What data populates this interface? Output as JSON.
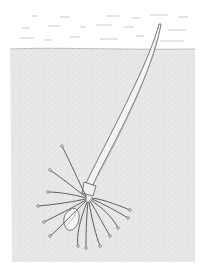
{
  "image": {
    "subject": "Botanical illustration of a germinating seedling",
    "description": "A sprouted seed with a long, tapering shoot rising diagonally toward the surface and a cluster of thin roots spreading below, embedded in stippled soil beneath a white band with faint horizontal strokes.",
    "elements": [
      {
        "name": "surface-band",
        "description": "White area with faint horizontal dash strokes"
      },
      {
        "name": "soil",
        "description": "Stippled gray rectangular region"
      },
      {
        "name": "shoot",
        "description": "Long tapered stalk rising to upper right"
      },
      {
        "name": "roots",
        "description": "Thin radiating roots with small tips"
      },
      {
        "name": "seed-coat",
        "description": "Small shell fragment at base of roots"
      }
    ]
  },
  "colors": {
    "background": "#ffffff",
    "soil": "#e6e6e6",
    "ink": "#555555",
    "shoot_fill": "#f4f4f2"
  }
}
